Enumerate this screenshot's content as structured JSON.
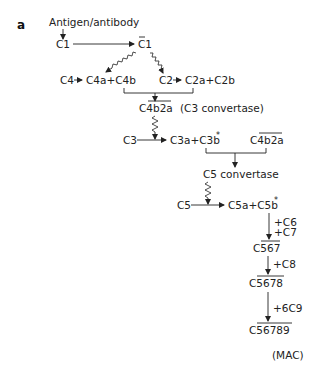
{
  "panel_label": "a",
  "nodes": {
    "start": "Antigen/antibody",
    "c1": "C1",
    "c1_active": "C1",
    "c4": "C4",
    "c4_products": "C4a+C4b",
    "c2": "C2",
    "c2_products": "C2a+C2b",
    "c3_convertase": "C4b2a",
    "c3_convertase_note": "(C3 convertase)",
    "c3": "C3",
    "c3_products": "C3a+C3b",
    "c3_products_star": "*",
    "c4b2a_repeat": "C4b2a",
    "c5_convertase": "C5 convertase",
    "c5": "C5",
    "c5_products": "C5a+C5b",
    "c5_products_star": "*",
    "add_c6": "+C6",
    "add_c7": "+C7",
    "c567": "C567",
    "add_c8": "+C8",
    "c5678": "C5678",
    "add_c9": "+6C9",
    "c56789": "C56789",
    "mac": "(MAC)"
  },
  "edges": [
    {
      "from": "start",
      "to": "c1",
      "type": "arrow"
    },
    {
      "from": "c1",
      "to": "c1_active",
      "type": "arrow"
    },
    {
      "from": "c1_active",
      "to": "c4b",
      "type": "enzymatic"
    },
    {
      "from": "c1_active",
      "to": "c2",
      "type": "enzymatic"
    },
    {
      "from": "c4",
      "to": "c4_products",
      "type": "arrow"
    },
    {
      "from": "c2",
      "to": "c2_products",
      "type": "arrow"
    },
    {
      "from": [
        "c4b",
        "c2a"
      ],
      "to": "c3_convertase",
      "type": "bracket"
    },
    {
      "from": "c3_convertase",
      "to": "c3_reaction",
      "type": "enzymatic"
    },
    {
      "from": "c3",
      "to": "c3_products",
      "type": "arrow"
    },
    {
      "from": [
        "c3b",
        "c4b2a_repeat"
      ],
      "to": "c5_convertase",
      "type": "bracket"
    },
    {
      "from": "c5_convertase",
      "to": "c5_reaction",
      "type": "enzymatic"
    },
    {
      "from": "c5",
      "to": "c5_products",
      "type": "arrow"
    },
    {
      "from": "c5b",
      "to": "c567",
      "type": "arrow",
      "label": "+C6 +C7"
    },
    {
      "from": "c567",
      "to": "c5678",
      "type": "arrow",
      "label": "+C8"
    },
    {
      "from": "c5678",
      "to": "c56789",
      "type": "arrow",
      "label": "+6C9"
    }
  ]
}
